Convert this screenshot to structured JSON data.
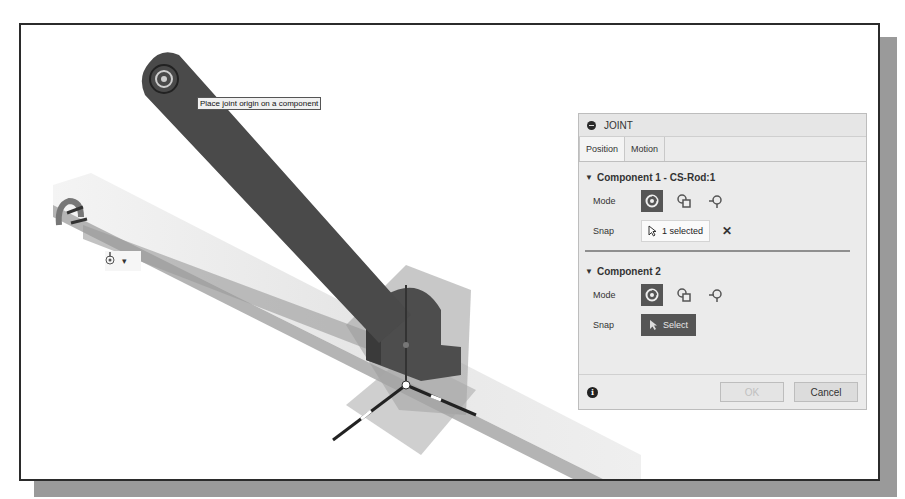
{
  "viewport": {
    "tooltip": "Place joint origin on a component",
    "mini_toolbar": {
      "icon": "joint-origin-icon",
      "dropdown": "▾"
    }
  },
  "panel": {
    "title": "JOINT",
    "tabs": [
      {
        "label": "Position",
        "active": true
      },
      {
        "label": "Motion",
        "active": false
      }
    ],
    "component1": {
      "title": "Component 1 - CS-Rod:1",
      "mode_label": "Mode",
      "snap_label": "Snap",
      "snap_value": "1 selected",
      "clear": "✕"
    },
    "component2": {
      "title": "Component 2",
      "mode_label": "Mode",
      "snap_label": "Snap",
      "snap_button": "Select"
    },
    "footer": {
      "info": "i",
      "ok": "OK",
      "cancel": "Cancel"
    }
  },
  "colors": {
    "rod": "#4a4a4a",
    "active_mode": "#555555",
    "panel_bg": "#ebebeb",
    "frame_border": "#2b2b2b",
    "shadow": "#9a9a9a"
  }
}
